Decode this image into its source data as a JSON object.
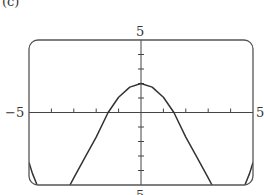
{
  "panel_label": "(c)",
  "chart_data": {
    "type": "line",
    "title": "",
    "xlabel": "",
    "ylabel": "",
    "xlim": [
      -5,
      5
    ],
    "ylim": [
      -5,
      5
    ],
    "grid": false,
    "legend": null,
    "tick_labels": {
      "x_min": "−5",
      "x_max": "5",
      "y_max": "5",
      "y_min": "5"
    },
    "x_ticks": [
      -4,
      -3,
      -2,
      -1,
      1,
      2,
      3,
      4
    ],
    "y_ticks": [
      -4,
      -3,
      -2,
      -1,
      1,
      2,
      3,
      4
    ],
    "series": [
      {
        "name": "f(x)",
        "x": [
          -5,
          -4.85,
          -4.64,
          -4.5,
          -4,
          -3.5,
          -3.17,
          -3,
          -2.5,
          -2,
          -1.47,
          -1,
          -0.5,
          0,
          0.5,
          1,
          1.47,
          2,
          2.5,
          3,
          3.17,
          3.5,
          4,
          4.5,
          4.64,
          4.85,
          5
        ],
        "y": [
          -3.45,
          -4.2,
          -5,
          -5.6,
          -6.6,
          -6.3,
          -5,
          -4.5,
          -3.1,
          -1.7,
          0,
          1.05,
          1.75,
          2,
          1.75,
          1.05,
          0,
          -1.7,
          -3.1,
          -4.5,
          -5,
          -6.3,
          -6.6,
          -5.6,
          -5,
          -4.2,
          -3.45
        ]
      }
    ],
    "annotations": []
  },
  "colors": {
    "curve": "#333333",
    "frame": "#555555",
    "background": "#ffffff"
  }
}
